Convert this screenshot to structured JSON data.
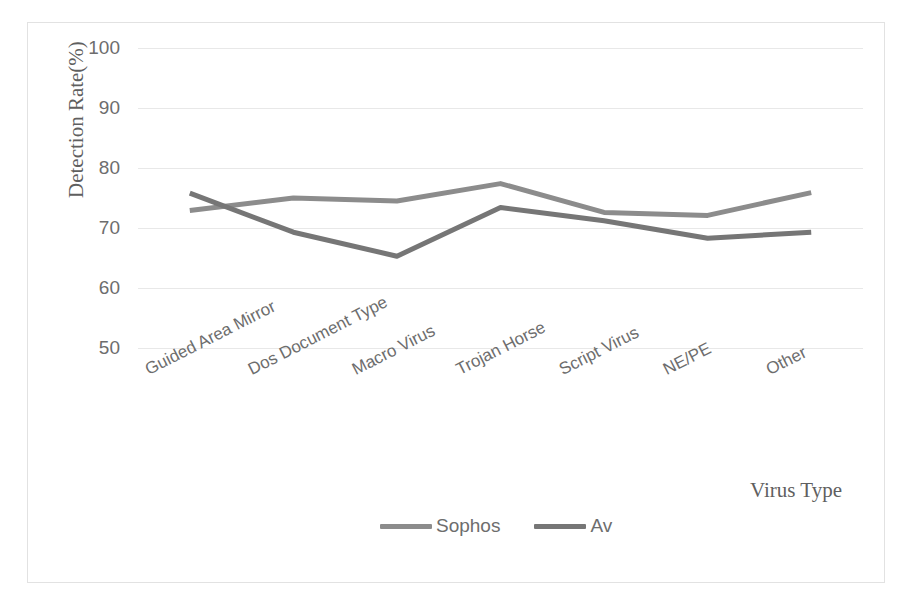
{
  "chart_data": {
    "type": "line",
    "title": "",
    "xlabel": "Virus Type",
    "ylabel": "Detection Rate(%)",
    "ylim": [
      50,
      100
    ],
    "yticks": [
      100,
      90,
      80,
      70,
      60,
      50
    ],
    "grid": true,
    "legend_position": "bottom",
    "categories": [
      "Guided Area Mirror",
      "Dos Document Type",
      "Macro Virus",
      "Trojan Horse",
      "Script Virus",
      "NE/PE",
      "Other"
    ],
    "series": [
      {
        "name": "Sophos",
        "color": "#8c8c8c",
        "values": [
          72.9,
          75.0,
          74.5,
          77.4,
          72.6,
          72.1,
          75.9
        ]
      },
      {
        "name": "Av",
        "color": "#767676",
        "values": [
          75.8,
          69.3,
          65.3,
          73.4,
          71.2,
          68.3,
          69.3
        ]
      }
    ]
  },
  "figure": {
    "border_color": "#e2e2e2",
    "background": "#ffffff",
    "gridline_color": "#e8e8e8",
    "tick_label_color": "#6d6d6d",
    "axis_title_color": "#5f5f5f"
  }
}
